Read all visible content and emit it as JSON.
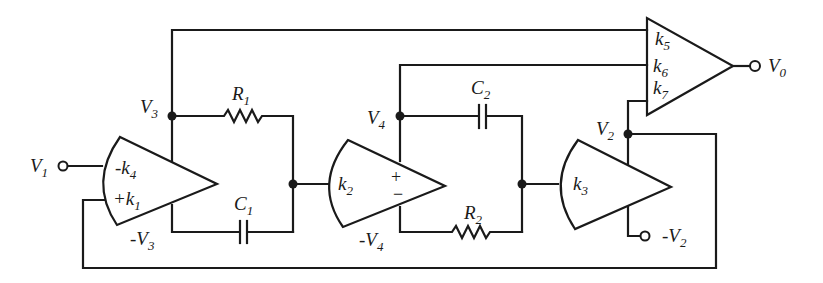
{
  "diagram": {
    "type": "analog computer circuit (state-variable filter)",
    "nodes": {
      "V1": {
        "label": "V",
        "sub": "1"
      },
      "V0": {
        "label": "V",
        "sub": "0"
      },
      "V2": {
        "label": "V",
        "sub": "2"
      },
      "V3": {
        "label": "V",
        "sub": "3"
      },
      "V4": {
        "label": "V",
        "sub": "4"
      },
      "neg_V2": {
        "label": "-V",
        "sub": "2"
      },
      "neg_V3": {
        "label": "-V",
        "sub": "3"
      },
      "neg_V4": {
        "label": "-V",
        "sub": "4"
      }
    },
    "components": {
      "R1": {
        "label": "R",
        "sub": "1"
      },
      "R2": {
        "label": "R",
        "sub": "2"
      },
      "C1": {
        "label": "C",
        "sub": "1"
      },
      "C2": {
        "label": "C",
        "sub": "2"
      }
    },
    "amplifiers": {
      "amp1": {
        "inputs": [
          {
            "label": "-k",
            "sub": "4"
          },
          {
            "label": "+k",
            "sub": "1"
          }
        ]
      },
      "amp2": {
        "gain": {
          "label": "k",
          "sub": "2"
        },
        "plus": "+",
        "minus": "−"
      },
      "amp3": {
        "gain": {
          "label": "k",
          "sub": "3"
        }
      },
      "summer": {
        "inputs": [
          {
            "label": "k",
            "sub": "5"
          },
          {
            "label": "k",
            "sub": "6"
          },
          {
            "label": "k",
            "sub": "7"
          }
        ]
      }
    }
  }
}
